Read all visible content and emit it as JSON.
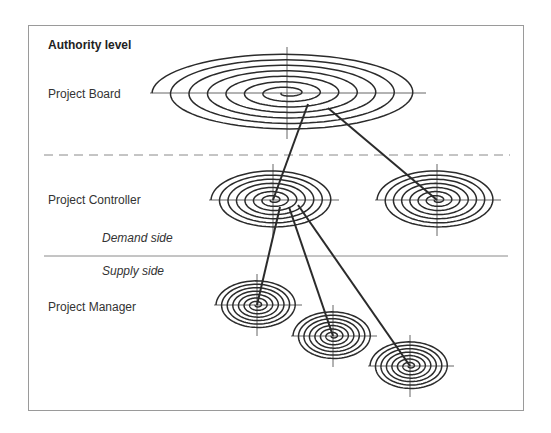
{
  "title": "Authority level",
  "levels": [
    {
      "label": "Project Board",
      "x": 48,
      "y": 87
    },
    {
      "label": "Project Controller",
      "x": 48,
      "y": 193
    },
    {
      "label": "Project Manager",
      "x": 48,
      "y": 300
    }
  ],
  "divider_labels": [
    {
      "label": "Demand side",
      "x": 102,
      "y": 230
    },
    {
      "label": "Supply side",
      "x": 102,
      "y": 264
    }
  ],
  "dividers": [
    {
      "type": "dashed",
      "y": 155,
      "x1": 44,
      "x2": 510
    },
    {
      "type": "solid",
      "y": 256,
      "x1": 44,
      "x2": 508
    }
  ],
  "nodes": [
    {
      "id": "board",
      "role": "Project Board",
      "cx": 287,
      "cy": 93,
      "rx": 135,
      "ry": 40,
      "turns": 7
    },
    {
      "id": "controller-1",
      "role": "Project Controller",
      "cx": 273,
      "cy": 200,
      "rx": 62,
      "ry": 30,
      "turns": 7
    },
    {
      "id": "controller-2",
      "role": "Project Controller",
      "cx": 437,
      "cy": 200,
      "rx": 60,
      "ry": 30,
      "turns": 7
    },
    {
      "id": "manager-1",
      "role": "Project Manager",
      "cx": 257,
      "cy": 305,
      "rx": 41,
      "ry": 25,
      "turns": 7
    },
    {
      "id": "manager-2",
      "role": "Project Manager",
      "cx": 333,
      "cy": 336,
      "rx": 40,
      "ry": 25,
      "turns": 7
    },
    {
      "id": "manager-3",
      "role": "Project Manager",
      "cx": 410,
      "cy": 366,
      "rx": 40,
      "ry": 25,
      "turns": 7
    }
  ],
  "links": [
    {
      "from": "board",
      "to": "controller-1",
      "x1": 308,
      "y1": 104,
      "x2": 273,
      "y2": 200
    },
    {
      "from": "board",
      "to": "controller-2",
      "x1": 328,
      "y1": 108,
      "x2": 437,
      "y2": 200
    },
    {
      "from": "controller-1",
      "to": "manager-1",
      "x1": 280,
      "y1": 207,
      "x2": 257,
      "y2": 305
    },
    {
      "from": "controller-1",
      "to": "manager-2",
      "x1": 289,
      "y1": 207,
      "x2": 333,
      "y2": 336
    },
    {
      "from": "controller-1",
      "to": "manager-3",
      "x1": 298,
      "y1": 205,
      "x2": 410,
      "y2": 366
    }
  ],
  "colors": {
    "ink": "#2b2b2b",
    "frame": "#9a9a9a",
    "rule": "#8a8a8a"
  }
}
